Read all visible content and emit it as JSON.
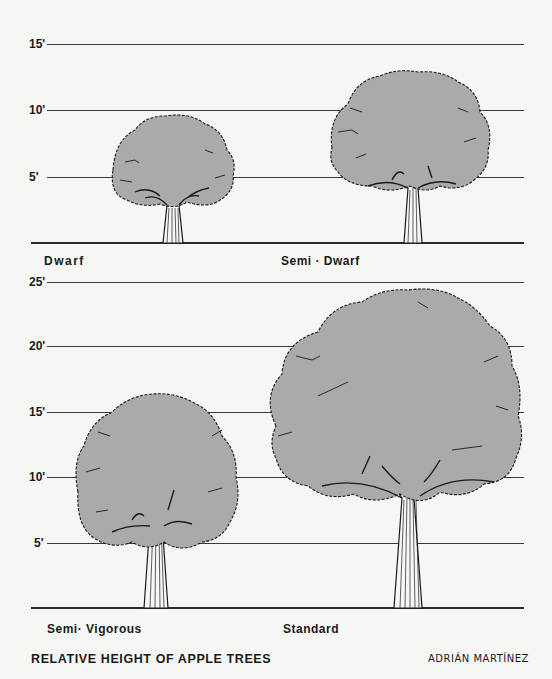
{
  "title": "RELATIVE HEIGHT OF APPLE TREES",
  "author": "ADRIÁN MARTÍNEZ",
  "colors": {
    "canopy": "#aaaaaa",
    "outline": "#1a1a1a",
    "background": "#f6f6f4",
    "lines": "#3a3a3a"
  },
  "top_panel": {
    "ticks": [
      "15'",
      "10'",
      "5'"
    ],
    "trees": [
      {
        "label": "Dwarf",
        "approx_height_ft": 10
      },
      {
        "label": "Semi · Dwarf",
        "approx_height_ft": 14
      }
    ]
  },
  "bottom_panel": {
    "ticks": [
      "25'",
      "20'",
      "15'",
      "10'",
      "5'"
    ],
    "trees": [
      {
        "label": "Semi· Vigorous",
        "approx_height_ft": 16
      },
      {
        "label": "Standard",
        "approx_height_ft": 25
      }
    ]
  }
}
